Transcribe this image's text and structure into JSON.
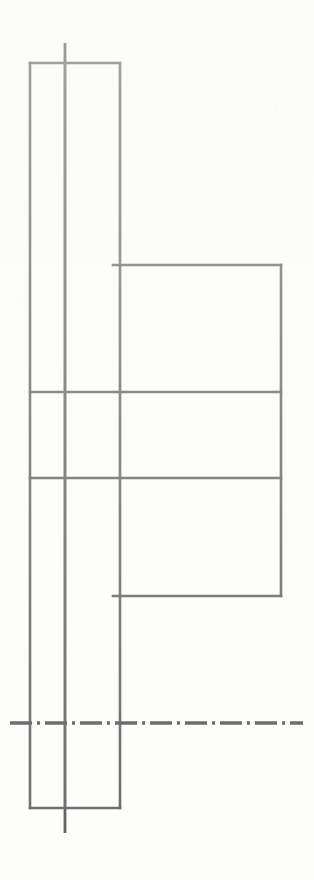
{
  "drawing": {
    "title": "Orthographic section drawing",
    "canvas": {
      "width": 314,
      "height": 880,
      "background": "#fdfdfc"
    },
    "line_color": "#3a3a3a",
    "outline_width": 2.6,
    "centerline_color": "#2e2e2e",
    "centerline_width": 3.0,
    "centerline_dash": "22 5 3 5",
    "shapes": {
      "flange_outer_rect": {
        "name": "flange-outline",
        "x": 30,
        "y": 63,
        "width": 90,
        "height": 745,
        "label": "tall left rectangle"
      },
      "flange_inner_line": {
        "name": "flange-inner-vertical",
        "x": 65,
        "y1": 63,
        "y2": 808
      },
      "hub_rect": {
        "name": "hub-outline",
        "x": 113,
        "y": 265,
        "width": 168,
        "height": 331,
        "label": "right rectangle"
      },
      "divider_upper": {
        "name": "divider-line-upper",
        "x1": 30,
        "x2": 281,
        "y": 392
      },
      "divider_lower": {
        "name": "divider-line-lower",
        "x1": 30,
        "x2": 281,
        "y": 478
      },
      "vertical_centerline": {
        "name": "vertical-centerline",
        "x": 65,
        "y1": 43,
        "y2": 833
      },
      "horizontal_centerline": {
        "name": "horizontal-centerline",
        "y": 723,
        "x1": 10,
        "x2": 303
      }
    }
  }
}
